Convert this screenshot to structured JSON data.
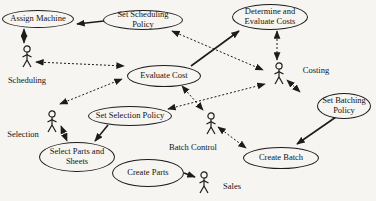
{
  "diagram": {
    "type": "uml-use-case-diagram",
    "colors": {
      "background": "#f6f5f1",
      "line": "#1c1c1c",
      "text": "#141414"
    },
    "use_cases": [
      {
        "id": "assign-machine",
        "label": "Assign Machine"
      },
      {
        "id": "set-scheduling-policy",
        "label": "Set Scheduling Policy"
      },
      {
        "id": "determine-evaluate-costs",
        "label": "Determine and Evaluate Costs"
      },
      {
        "id": "evaluate-cost",
        "label": "Evaluate Cost"
      },
      {
        "id": "set-selection-policy",
        "label": "Set Selection Policy"
      },
      {
        "id": "select-parts-sheets",
        "label": "Select Parts and Sheets"
      },
      {
        "id": "create-parts",
        "label": "Create Parts"
      },
      {
        "id": "create-batch",
        "label": "Create Batch"
      },
      {
        "id": "set-batching-policy",
        "label": "Set Batching Policy"
      }
    ],
    "actors": [
      {
        "id": "scheduling",
        "label": "Scheduling"
      },
      {
        "id": "selection",
        "label": "Selection"
      },
      {
        "id": "costing",
        "label": "Costing"
      },
      {
        "id": "batch-control",
        "label": "Batch Control"
      },
      {
        "id": "sales",
        "label": "Sales"
      }
    ],
    "relationships": [
      {
        "from": "set-scheduling-policy",
        "to": "assign-machine",
        "style": "solid",
        "arrows": "end"
      },
      {
        "from": "scheduling",
        "to": "assign-machine",
        "style": "dashed",
        "arrows": "both"
      },
      {
        "from": "scheduling",
        "to": "evaluate-cost",
        "style": "dashed",
        "arrows": "both"
      },
      {
        "from": "selection",
        "to": "evaluate-cost",
        "style": "dashed",
        "arrows": "both"
      },
      {
        "from": "selection",
        "to": "select-parts-sheets",
        "style": "dashed",
        "arrows": "both"
      },
      {
        "from": "set-selection-policy",
        "to": "select-parts-sheets",
        "style": "solid",
        "arrows": "end"
      },
      {
        "from": "evaluate-cost",
        "to": "determine-evaluate-costs",
        "style": "solid",
        "arrows": "end"
      },
      {
        "from": "set-scheduling-policy",
        "to": "costing",
        "style": "dashed",
        "arrows": "both"
      },
      {
        "from": "determine-evaluate-costs",
        "to": "costing",
        "style": "dashed",
        "arrows": "both"
      },
      {
        "from": "set-selection-policy",
        "to": "costing",
        "style": "dashed",
        "arrows": "both"
      },
      {
        "from": "evaluate-cost",
        "to": "batch-control",
        "style": "dashed",
        "arrows": "both"
      },
      {
        "from": "costing",
        "to": "set-batching-policy",
        "style": "dashed",
        "arrows": "both"
      },
      {
        "from": "set-batching-policy",
        "to": "create-batch",
        "style": "solid",
        "arrows": "end"
      },
      {
        "from": "batch-control",
        "to": "create-batch",
        "style": "dashed",
        "arrows": "both"
      },
      {
        "from": "create-parts",
        "to": "sales",
        "style": "solid",
        "arrows": "end"
      }
    ]
  }
}
